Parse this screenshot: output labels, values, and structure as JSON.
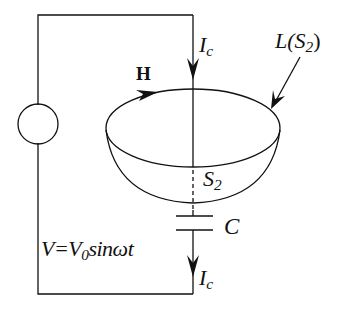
{
  "diagram": {
    "labels": {
      "current_top": {
        "main": "I",
        "sub": "c"
      },
      "current_bottom": {
        "main": "I",
        "sub": "c"
      },
      "magnetic_field": "H",
      "loop": {
        "main": "L(S",
        "sub": "2",
        "close": ")"
      },
      "surface": {
        "main": "S",
        "sub": "2"
      },
      "capacitor": "C",
      "source": {
        "left": "V=V",
        "sub": "0",
        "right": "sinωt"
      }
    },
    "colors": {
      "stroke": "#111111",
      "background": "#ffffff"
    }
  }
}
